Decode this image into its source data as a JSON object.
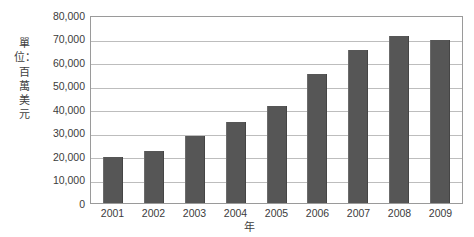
{
  "chart_data": {
    "type": "bar",
    "title": "",
    "subtitle": "",
    "xlabel": "年",
    "ylabel": "單位：百萬美元",
    "categories": [
      "2001",
      "2002",
      "2003",
      "2004",
      "2005",
      "2006",
      "2007",
      "2008",
      "2009"
    ],
    "values": [
      19500,
      22300,
      28500,
      34300,
      41300,
      54700,
      65000,
      71000,
      69400
    ],
    "series": [
      {
        "name": "",
        "values": [
          19500,
          22300,
          28500,
          34300,
          41300,
          54700,
          65000,
          71000,
          69400
        ]
      }
    ],
    "ylim": [
      0,
      80000
    ],
    "ytick_values": [
      0,
      10000,
      20000,
      30000,
      40000,
      50000,
      60000,
      70000,
      80000
    ],
    "ytick_labels": [
      "0",
      "10,000",
      "20,000",
      "30,000",
      "40,000",
      "50,000",
      "60,000",
      "70,000",
      "80,000"
    ],
    "grid": true,
    "grid_axis": "y",
    "legend": false,
    "legend_position": "none",
    "bar_color": "#565656",
    "gridline_color": "#bdbdbd",
    "plot_border_color": "#9a9a9a",
    "background_color": "#ffffff",
    "text_color": "#3b3b3b"
  },
  "axes": {
    "y_title_text": "單位：百萬美元",
    "x_title_text": "年"
  }
}
